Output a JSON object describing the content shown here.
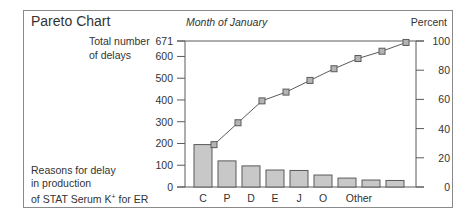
{
  "chart_data": {
    "type": "bar",
    "title": "Pareto Chart",
    "subtitle": "Month of January",
    "ylabel_left": [
      "Total number",
      "of delays"
    ],
    "ylabel_right": "Percent",
    "xlabel": [
      "Reasons for delay",
      "in production",
      "of STAT Serum K",
      "+",
      " for ER"
    ],
    "left_axis": {
      "ticks": [
        0,
        100,
        200,
        300,
        400,
        500,
        600,
        671
      ],
      "range": [
        0,
        671
      ]
    },
    "right_axis": {
      "ticks": [
        0,
        20,
        40,
        60,
        80,
        100
      ],
      "range": [
        0,
        100
      ]
    },
    "categories": [
      "C",
      "P",
      "D",
      "E",
      "J",
      "O",
      "",
      "",
      ""
    ],
    "category_labels": [
      {
        "text": "C",
        "bar": 0
      },
      {
        "text": "P",
        "bar": 1
      },
      {
        "text": "D",
        "bar": 2
      },
      {
        "text": "E",
        "bar": 3
      },
      {
        "text": "J",
        "bar": 4
      },
      {
        "text": "O",
        "bar": 5
      },
      {
        "text": "Other",
        "bar": 6.5
      }
    ],
    "series": [
      {
        "name": "Number of delays",
        "type": "bar",
        "values": [
          195,
          120,
          97,
          78,
          76,
          55,
          41,
          32,
          30
        ]
      },
      {
        "name": "Cumulative percent",
        "type": "line",
        "axis": "right",
        "values": [
          29,
          44,
          59,
          65,
          73,
          81,
          88,
          93,
          99
        ]
      }
    ],
    "grid": false,
    "legend": null
  },
  "colors": {
    "bar_fill": "#c8c8c8",
    "bar_stroke": "#5a5a5a",
    "line": "#5a5a5a",
    "marker_fill": "#b4b4b4",
    "axis": "#5a5a5a",
    "frame": "#8a8a8a"
  }
}
